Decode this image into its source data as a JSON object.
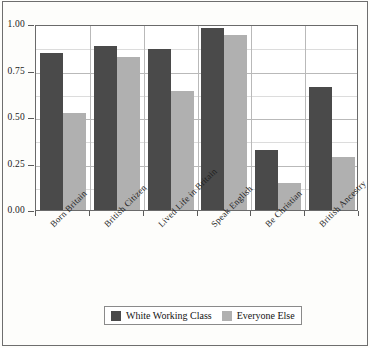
{
  "chart_data": {
    "type": "bar",
    "title": "",
    "subtitle": "",
    "xlabel": "",
    "ylabel": "",
    "ylim": [
      0,
      1.0
    ],
    "ytick_labels": [
      "0.00",
      "0.25",
      "0.50",
      "0.75",
      "1.00"
    ],
    "ytick_values": [
      0.0,
      0.25,
      0.5,
      0.75,
      1.0
    ],
    "grid": true,
    "legend_position": "bottom",
    "categories": [
      "Born Britain",
      "British Citizen",
      "Lived Life in Britain",
      "Speak English",
      "Be Christian",
      "British Ancestry"
    ],
    "series": [
      {
        "name": "White Working Class",
        "color": "#4a4a4a",
        "values": [
          0.845,
          0.88,
          0.865,
          0.98,
          0.32,
          0.66
        ]
      },
      {
        "name": "Everyone Else",
        "color": "#b0b0b0",
        "values": [
          0.52,
          0.825,
          0.64,
          0.94,
          0.145,
          0.285
        ]
      }
    ]
  },
  "legend": {
    "entries": [
      {
        "label": "White Working Class",
        "swatch": "dark-gray-swatch"
      },
      {
        "label": "Everyone Else",
        "swatch": "light-gray-swatch"
      }
    ]
  }
}
